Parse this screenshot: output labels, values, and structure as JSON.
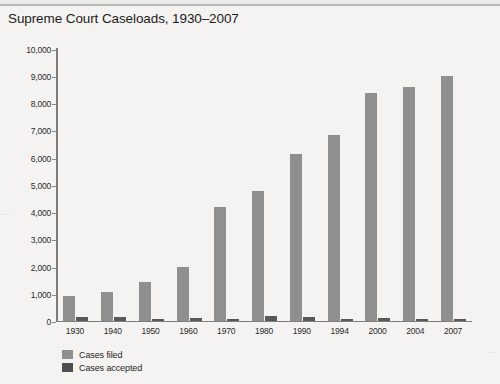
{
  "chart_data": {
    "type": "bar",
    "title": "Supreme Court Caseloads, 1930–2007",
    "xlabel": "",
    "ylabel": "",
    "ylim": [
      0,
      10000
    ],
    "yticks": [
      0,
      1000,
      2000,
      3000,
      4000,
      5000,
      6000,
      7000,
      8000,
      9000,
      10000
    ],
    "ytick_labels": [
      "0",
      "1,000",
      "2,000",
      "3,000",
      "4,000",
      "5,000",
      "6,000",
      "7,000",
      "8,000",
      "9,000",
      "10,000"
    ],
    "grid": false,
    "legend_position": "below-left",
    "categories": [
      "1930",
      "1940",
      "1950",
      "1960",
      "1970",
      "1980",
      "1990",
      "1994",
      "2000",
      "2004",
      "2007"
    ],
    "series": [
      {
        "name": "Cases filed",
        "color": "#8f8f8f",
        "values": [
          900,
          1050,
          1400,
          1950,
          4150,
          4760,
          6120,
          6790,
          8340,
          8580,
          8960
        ]
      },
      {
        "name": "Cases accepted",
        "color": "#585858",
        "values": [
          130,
          130,
          60,
          90,
          60,
          170,
          140,
          50,
          80,
          60,
          70
        ]
      }
    ]
  },
  "legend": {
    "items": [
      {
        "label": "Cases filed",
        "color": "#8f8f8f"
      },
      {
        "label": "Cases accepted",
        "color": "#4f4f4f"
      }
    ]
  }
}
